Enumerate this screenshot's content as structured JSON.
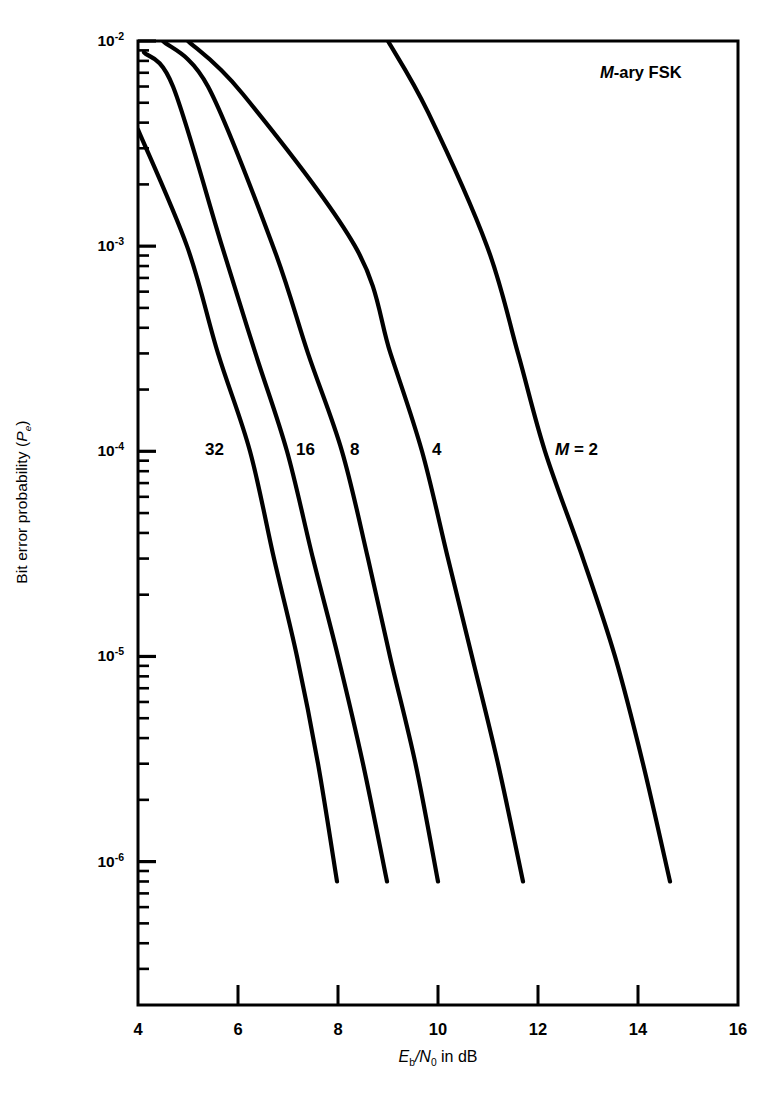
{
  "figure": {
    "annotation": "M-ary FSK",
    "annotation_italic_part": "M",
    "annotation_rest": "-ary FSK"
  },
  "axes": {
    "x": {
      "label_prefix": "E",
      "label_sub1": "b",
      "label_mid": "/N",
      "label_sub2": "0",
      "label_suffix": " in dB",
      "label_plain": "Eb/N0 in dB",
      "ticks": [
        "4",
        "6",
        "8",
        "10",
        "12",
        "14",
        "16"
      ],
      "min": 4,
      "max": 16
    },
    "y": {
      "label_prefix": "Bit error probability (",
      "label_italic": "P",
      "label_sub": "e",
      "label_suffix": ")",
      "label_plain": "Bit error probability (Pe)",
      "ticks": [
        {
          "mantissa": "10",
          "exponent": "-2"
        },
        {
          "mantissa": "10",
          "exponent": "-3"
        },
        {
          "mantissa": "10",
          "exponent": "-4"
        },
        {
          "mantissa": "10",
          "exponent": "-5"
        },
        {
          "mantissa": "10",
          "exponent": "-6"
        }
      ],
      "top": 0.01,
      "bottom": 2e-07
    }
  },
  "curve_labels": [
    {
      "text": "32"
    },
    {
      "text": "16"
    },
    {
      "text": "8"
    },
    {
      "text": "4"
    },
    {
      "text": "M = 2"
    }
  ],
  "colors": {
    "axis": "#000000",
    "curve": "#000000",
    "background": "#ffffff"
  },
  "chart_data": {
    "type": "line",
    "title": "",
    "annotation": "M-ary FSK",
    "xlabel": "Eb/N0 in dB",
    "ylabel": "Bit error probability (Pe)",
    "xscale": "linear",
    "yscale": "log",
    "xlim": [
      4,
      16
    ],
    "ylim": [
      2e-07,
      0.01
    ],
    "xticks": [
      4,
      6,
      8,
      10,
      12,
      14,
      16
    ],
    "yticks": [
      0.01,
      0.001,
      0.0001,
      1e-05,
      1e-06
    ],
    "grid": false,
    "legend": "inline-curve-labels",
    "series": [
      {
        "name": "M = 32",
        "label": "32",
        "x": [
          4.0,
          4.98,
          5.6,
          6.24,
          6.72,
          7.18,
          7.6,
          7.98
        ],
        "y": [
          0.0037,
          0.001,
          0.0003,
          0.0001,
          3e-05,
          1e-05,
          3e-06,
          8e-07
        ]
      },
      {
        "name": "M = 16",
        "label": "16",
        "x": [
          4.12,
          4.7,
          5.68,
          6.35,
          6.98,
          7.5,
          8.0,
          8.5,
          8.98
        ],
        "y": [
          0.0088,
          0.006,
          0.001,
          0.0003,
          0.0001,
          3e-05,
          1e-05,
          3e-06,
          8e-07
        ]
      },
      {
        "name": "M = 8",
        "label": "8",
        "x": [
          4.5,
          5.4,
          6.7,
          7.4,
          8.08,
          8.6,
          9.04,
          9.55,
          10.0
        ],
        "y": [
          0.01,
          0.006,
          0.001,
          0.0003,
          0.0001,
          3e-05,
          1e-05,
          3e-06,
          8e-07
        ]
      },
      {
        "name": "M = 4",
        "label": "4",
        "x": [
          5.0,
          6.1,
          8.34,
          9.05,
          9.68,
          10.2,
          10.68,
          11.2,
          11.7
        ],
        "y": [
          0.01,
          0.0055,
          0.001,
          0.0003,
          0.0001,
          3e-05,
          1e-05,
          3e-06,
          8e-07
        ]
      },
      {
        "name": "M = 2",
        "label": "M = 2",
        "x": [
          9.0,
          9.8,
          10.98,
          11.6,
          12.14,
          12.9,
          13.54,
          14.1,
          14.64
        ],
        "y": [
          0.01,
          0.0045,
          0.001,
          0.0003,
          0.0001,
          3e-05,
          1e-05,
          3e-06,
          8e-07
        ]
      }
    ]
  }
}
